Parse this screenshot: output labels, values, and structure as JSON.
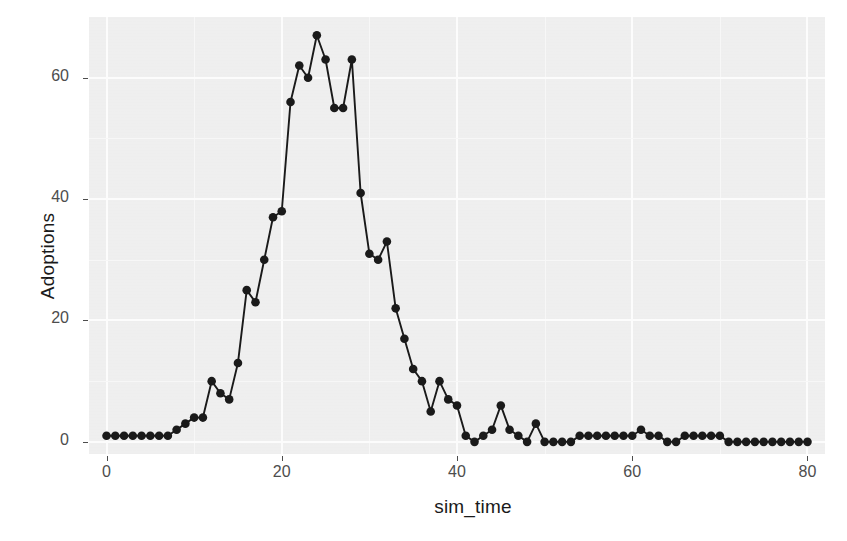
{
  "chart_data": {
    "type": "line",
    "title": "",
    "xlabel": "sim_time",
    "ylabel": "Adoptions",
    "xlim": [
      -2,
      82
    ],
    "ylim": [
      -2,
      70
    ],
    "xticks": [
      0,
      20,
      40,
      60,
      80
    ],
    "yticks": [
      0,
      20,
      40,
      60
    ],
    "grid": true,
    "legend": null,
    "marker": "filled-circle",
    "marker_color": "#1a1a1a",
    "line_color": "#1a1a1a",
    "panel_background": "#f1f1f1",
    "series": [
      {
        "name": "Adoptions",
        "x": [
          0,
          1,
          2,
          3,
          4,
          5,
          6,
          7,
          8,
          9,
          10,
          11,
          12,
          13,
          14,
          15,
          16,
          17,
          18,
          19,
          20,
          21,
          22,
          23,
          24,
          25,
          26,
          27,
          28,
          29,
          30,
          31,
          32,
          33,
          34,
          35,
          36,
          37,
          38,
          39,
          40,
          41,
          42,
          43,
          44,
          45,
          46,
          47,
          48,
          49,
          50,
          51,
          52,
          53,
          54,
          55,
          56,
          57,
          58,
          59,
          60,
          61,
          62,
          63,
          64,
          65,
          66,
          67,
          68,
          69,
          70,
          71,
          72,
          73,
          74,
          75,
          76,
          77,
          78,
          79,
          80
        ],
        "y": [
          1,
          1,
          1,
          1,
          1,
          1,
          1,
          1,
          2,
          3,
          4,
          4,
          10,
          8,
          7,
          13,
          25,
          23,
          30,
          37,
          38,
          56,
          62,
          60,
          67,
          63,
          55,
          55,
          63,
          41,
          31,
          30,
          33,
          22,
          17,
          12,
          10,
          5,
          10,
          7,
          6,
          1,
          0,
          1,
          2,
          6,
          2,
          1,
          0,
          3,
          0,
          0,
          0,
          0,
          1,
          1,
          1,
          1,
          1,
          1,
          1,
          2,
          1,
          1,
          0,
          0,
          1,
          1,
          1,
          1,
          1,
          0,
          0,
          0,
          0,
          0,
          0,
          0,
          0,
          0,
          0
        ]
      }
    ]
  },
  "axis": {
    "x_tick_labels": [
      "0",
      "20",
      "40",
      "60",
      "80"
    ],
    "y_tick_labels": [
      "0",
      "20",
      "40",
      "60"
    ],
    "x_title": "sim_time",
    "y_title": "Adoptions"
  }
}
